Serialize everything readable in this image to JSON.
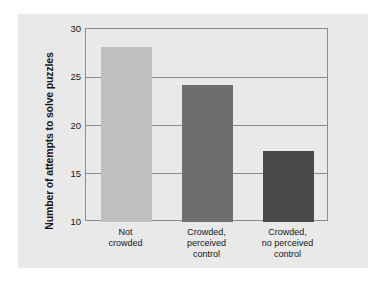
{
  "chart_data": {
    "type": "bar",
    "title": "",
    "xlabel": "",
    "ylabel": "Number of attempts to solve puzzles",
    "categories": [
      "Not\ncrowded",
      "Crowded,\nperceived\ncontrol",
      "Crowded,\nno perceived\ncontrol"
    ],
    "values": [
      28.1,
      24.2,
      17.4
    ],
    "bar_colors": [
      "#bfbfbf",
      "#6e6e6e",
      "#4a4a4a"
    ],
    "ylim": [
      10,
      30
    ],
    "yticks": [
      10,
      15,
      20,
      25,
      30
    ],
    "ytick_labels": [
      "10",
      "15",
      "20",
      "25",
      "30"
    ],
    "grid": "horizontal",
    "legend": "none"
  },
  "figure": {
    "panel_color": "#e9e9e9",
    "frame_color": "#8d8d8d",
    "text_color": "#151515"
  }
}
